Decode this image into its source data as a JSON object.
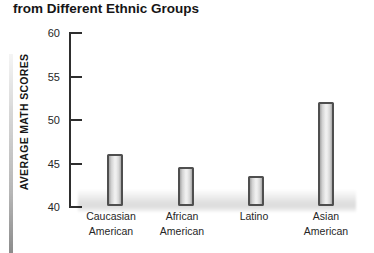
{
  "title": "from Different Ethnic Groups",
  "chart_data": {
    "type": "bar",
    "title": "from Different Ethnic Groups",
    "ylabel": "AVERAGE MATH SCORES",
    "xlabel": "",
    "categories": [
      "Caucasian American",
      "African American",
      "Latino",
      "Asian American"
    ],
    "values": [
      46,
      44.5,
      43.5,
      52
    ],
    "ylim": [
      40,
      60
    ],
    "yticks": [
      60,
      55,
      50,
      45,
      40
    ],
    "grid": false,
    "legend": null,
    "bar_style": "gray gradient with dark outline, soft floor shadow at baseline"
  },
  "colors": {
    "background": "#ffffff",
    "text": "#161616",
    "axis": "#2e2e2e",
    "bar_border": "#4f4f4f",
    "bar_fill_light": "#f0f0f0",
    "bar_fill_dark": "#a6a6a6"
  }
}
